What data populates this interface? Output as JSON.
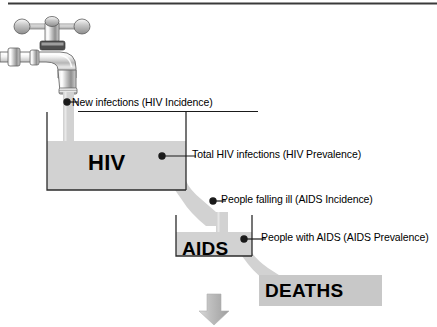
{
  "diagram": {
    "top_rule": true,
    "colors": {
      "fill_gray": "#d2d2d2",
      "outline_black": "#1a1a1a",
      "text_black": "#000000",
      "highlight_box_gray": "#c8c8c8",
      "arrow_gray": "#b9b9b9",
      "background": "#ffffff"
    },
    "icons": {
      "faucet": "faucet-icon",
      "water_stream": "water-stream-icon",
      "down_arrow": "down-arrow-icon"
    },
    "stocks": [
      {
        "id": "hiv",
        "label": "HIV"
      },
      {
        "id": "aids",
        "label": "AIDS"
      },
      {
        "id": "deaths",
        "label": "DEATHS"
      }
    ],
    "callouts": [
      {
        "id": "new-infections",
        "text": "New infections (HIV Incidence)",
        "kind": "flow"
      },
      {
        "id": "total-hiv-infections",
        "text": "Total HIV infections (HIV Prevalence)",
        "kind": "stock"
      },
      {
        "id": "people-falling-ill",
        "text": "People falling ill (AIDS Incidence)",
        "kind": "flow"
      },
      {
        "id": "people-with-aids",
        "text": "People with AIDS (AIDS Prevalence)",
        "kind": "stock"
      }
    ]
  }
}
